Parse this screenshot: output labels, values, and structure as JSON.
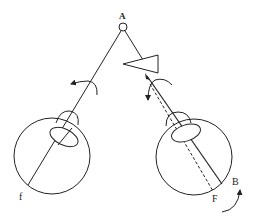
{
  "diagram": {
    "type": "eye-rotation-schematic",
    "labels": {
      "point_a": "A",
      "point_b": "B",
      "fovea_left": "f",
      "fovea_right": "F"
    },
    "colors": {
      "stroke": "#222222",
      "background": "#ffffff"
    },
    "elements": {
      "fixation_point": {
        "label": "A",
        "shape": "small-circle"
      },
      "prism": {
        "shape": "triangle",
        "apex_direction": "left"
      },
      "left_eye": {
        "fovea_label": "f",
        "rotation_arrow": "counter-clockwise"
      },
      "right_eye": {
        "fovea_label": "F",
        "rotation_arrow": "counter-clockwise",
        "deviated_axis": "dashed"
      },
      "arrow_b": {
        "label": "B",
        "direction": "up"
      }
    }
  }
}
